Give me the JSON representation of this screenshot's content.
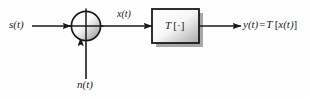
{
  "diagram": {
    "type": "block-diagram",
    "background_color": "#fefefe",
    "stroke_color": "#1a1a1a",
    "nodes": [
      {
        "id": "summer",
        "name": "summing-junction",
        "shape": "circle-with-cross",
        "cx": 86,
        "cy": 26,
        "r": 15,
        "fill_light": "#ffffff",
        "fill_dark": "#8c8c8c"
      },
      {
        "id": "system",
        "name": "system-block",
        "shape": "rectangle",
        "x": 152,
        "y": 9,
        "width": 47,
        "height": 34,
        "label": "T [·]",
        "label_operator": "T",
        "label_bracket_open": "[",
        "label_dot": "·",
        "label_bracket_close": "]",
        "fill_light": "#ffffff",
        "fill_dark": "#a8a8a8",
        "shadow_color": "#8a8a8a"
      }
    ],
    "labels": {
      "input_signal": "s(t)",
      "sum_output": "x(t)",
      "noise_input": "n(t)",
      "output_lhs": "y(t)",
      "output_equals": "=",
      "output_operator": "T",
      "output_bracket_open": "[",
      "output_argument": "x(t)",
      "output_bracket_close": "]"
    },
    "edges": [
      {
        "id": "e1",
        "name": "signal-input-arrow",
        "from": "s(t)",
        "to": "summing-junction",
        "direction": "right",
        "x1": 32,
        "y1": 26,
        "x2": 71,
        "y2": 26
      },
      {
        "id": "e2",
        "name": "noise-input-arrow",
        "from": "n(t)",
        "to": "summing-junction",
        "direction": "up",
        "x1": 86,
        "y1": 78,
        "x2": 86,
        "y2": 42
      },
      {
        "id": "e3",
        "name": "sum-to-system-arrow",
        "from": "summing-junction",
        "to": "system-block",
        "direction": "right",
        "x1": 101,
        "y1": 26,
        "x2": 152,
        "y2": 26
      },
      {
        "id": "e4",
        "name": "system-output-arrow",
        "from": "system-block",
        "to": "y(t)",
        "direction": "right",
        "x1": 199,
        "y1": 26,
        "x2": 241,
        "y2": 26
      }
    ]
  }
}
